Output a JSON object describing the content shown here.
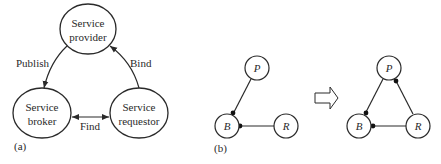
{
  "panel_a": {
    "label": "(a)",
    "nodes": {
      "provider": {
        "line1": "Service",
        "line2": "provider"
      },
      "broker": {
        "line1": "Service",
        "line2": "broker"
      },
      "requestor": {
        "line1": "Service",
        "line2": "requestor"
      }
    },
    "edges": {
      "publish": "Publish",
      "bind": "Bind",
      "find": "Find"
    }
  },
  "panel_b": {
    "label": "(b)",
    "before": {
      "p": "P",
      "b": "B",
      "r": "R"
    },
    "after": {
      "p": "P",
      "b": "B",
      "r": "R"
    },
    "transition_arrow": "hollow-right-arrow"
  },
  "colors": {
    "stroke": "#2a2a2a",
    "background": "#ffffff"
  }
}
